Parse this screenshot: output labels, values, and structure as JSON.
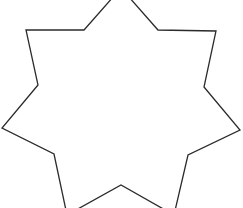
{
  "figure": {
    "shape": "seven-pointed star outline",
    "stroke_color": "#2b2b2b",
    "fill_color": "#ffffff",
    "stroke_width": 1.3,
    "points": "121,-12 158,30 216,31 204,87 240,130 188,155 174,215 121,185 67,215 54,154 2,128 38,85 26,30 84,30"
  }
}
